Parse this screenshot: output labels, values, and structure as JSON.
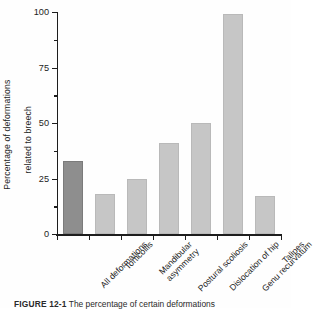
{
  "chart_data": {
    "type": "bar",
    "title": "",
    "xlabel": "",
    "ylabel": "Percentage of deformations related to breech",
    "ylabel_line1": "Percentage of deformations",
    "ylabel_line2": "related to breech",
    "ylim": [
      0,
      100
    ],
    "yticks": [
      0,
      25,
      50,
      75,
      100
    ],
    "ytick_labels": [
      "0",
      "25",
      "50",
      "75",
      "100"
    ],
    "yminor_ticks": [
      12.5,
      37.5,
      62.5,
      87.5
    ],
    "grid": false,
    "legend": "none",
    "categories": [
      "All deformations",
      "Torticollis",
      "Mandibular asymmetry",
      "Postural scoliosis",
      "Dislocation of hip",
      "Genu recurvatum",
      "Talipes"
    ],
    "category_lines": [
      [
        "All deformations"
      ],
      [
        "Torticollis"
      ],
      [
        "Mandibular",
        "asymmetry"
      ],
      [
        "Postural scoliosis"
      ],
      [
        "Dislocation of hip"
      ],
      [
        "Genu recurvatum"
      ],
      [
        "Talipes"
      ]
    ],
    "values": [
      33,
      18,
      25,
      41,
      50,
      99,
      17
    ],
    "bar_colors": [
      "#8e8e8e",
      "#c6c6c6",
      "#c6c6c6",
      "#c6c6c6",
      "#c6c6c6",
      "#c6c6c6",
      "#c6c6c6"
    ],
    "highlight_index": 0,
    "axis_color": "#1d1d1d"
  },
  "caption": {
    "label": "FIGURE 12-1",
    "text": "The percentage of certain deformations"
  }
}
